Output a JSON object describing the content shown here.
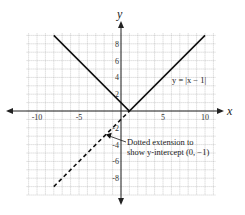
{
  "chart_data": {
    "type": "line",
    "title": "",
    "xlabel": "x",
    "ylabel": "y",
    "xlim": [
      -11,
      11
    ],
    "ylim": [
      -10,
      9
    ],
    "grid": true,
    "x_ticks": [
      "-10",
      "-5",
      "5",
      "10"
    ],
    "y_ticks": [
      "8",
      "6",
      "4",
      "2",
      "-2",
      "-4",
      "-6",
      "-8"
    ],
    "series": [
      {
        "name": "y = |x − 1|",
        "style": "solid",
        "x": [
          -8,
          1,
          10
        ],
        "y": [
          9,
          0,
          9
        ]
      },
      {
        "name": "Dotted extension",
        "style": "dashed",
        "x": [
          -8,
          1
        ],
        "y": [
          -9,
          0
        ]
      }
    ],
    "annotations": [
      {
        "text": "y = |x − 1|",
        "at": [
          7,
          4
        ]
      },
      {
        "text_line1": "Dotted extension to",
        "text_line2": "show y-intercept (0, −1)",
        "points_to": [
          -2,
          -3
        ]
      }
    ]
  },
  "labels": {
    "x_axis": "x",
    "y_axis": "y",
    "equation": "y = |x − 1|",
    "note_line1": "Dotted extension to",
    "note_line2": "show y-intercept (0, −1)"
  }
}
